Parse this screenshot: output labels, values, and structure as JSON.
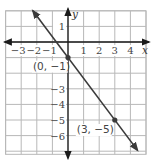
{
  "chart_data": {
    "type": "line",
    "title": "",
    "xlabel": "x",
    "ylabel": "y",
    "xlim": [
      -4,
      5
    ],
    "ylim": [
      -7.2,
      2
    ],
    "grid": true,
    "x_ticks": [
      "−3",
      "−2",
      "−1",
      "1",
      "2",
      "3",
      "4"
    ],
    "x_tick_values": [
      -3,
      -2,
      -1,
      1,
      2,
      3,
      4
    ],
    "y_ticks": [
      "1",
      "−3",
      "−4",
      "−5",
      "−6"
    ],
    "y_tick_values": [
      1,
      -3,
      -4,
      -5,
      -6
    ],
    "series": [
      {
        "name": "line",
        "equation": "y = -4/3 x - 1",
        "slope": -1.3333,
        "intercept": -1,
        "x": [
          -2.25,
          4.45
        ],
        "y": [
          2,
          -6.93
        ],
        "arrows": true
      }
    ],
    "points": [
      {
        "x": 0,
        "y": -1,
        "label": "(0, −1)"
      },
      {
        "x": 3,
        "y": -5,
        "label": "(3, −5)"
      }
    ]
  },
  "colors": {
    "line": "#3a3a3a",
    "axis": "#1a1a1a",
    "grid": "#b8b8b8",
    "point": "#3a3a3a"
  }
}
